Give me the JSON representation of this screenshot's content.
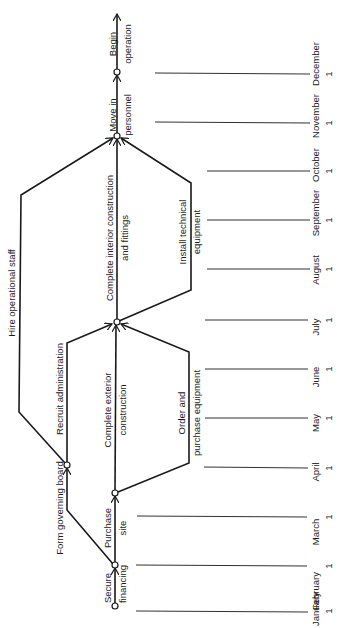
{
  "diagram": {
    "type": "PERT network (rotated 90°)",
    "months": [
      {
        "name": "January",
        "day": "1"
      },
      {
        "name": "February",
        "day": "1"
      },
      {
        "name": "March",
        "day": "1"
      },
      {
        "name": "April",
        "day": "1"
      },
      {
        "name": "May",
        "day": "1"
      },
      {
        "name": "June",
        "day": "1"
      },
      {
        "name": "July",
        "day": "1"
      },
      {
        "name": "August",
        "day": "1"
      },
      {
        "name": "September",
        "day": "1"
      },
      {
        "name": "October",
        "day": "1"
      },
      {
        "name": "November",
        "day": "1"
      },
      {
        "name": "December",
        "day": "1"
      }
    ],
    "activities": {
      "secure_financing": {
        "line1": "Secure",
        "line2": "financing"
      },
      "purchase_site": {
        "line1": "Purchase",
        "line2": "site"
      },
      "form_board": {
        "line1": "Form governing board"
      },
      "recruit_admin": {
        "line1": "Recruit administration"
      },
      "hire_staff": {
        "line1": "Hire operational staff"
      },
      "exterior": {
        "line1": "Complete exterior",
        "line2": "construction"
      },
      "order_equipment": {
        "line1": "Order and",
        "line2": "purchase equipment"
      },
      "interior": {
        "line1": "Complete interior construction",
        "line2": "and fittings"
      },
      "install_equipment": {
        "line1": "Install technical",
        "line2": "equipment"
      },
      "move_personnel": {
        "line1": "Move in",
        "line2": "personnel"
      },
      "begin_operation": {
        "line1": "Begin",
        "line2": "operation"
      }
    },
    "colors": {
      "line": "#1a1a1a",
      "background": "#ffffff"
    }
  }
}
